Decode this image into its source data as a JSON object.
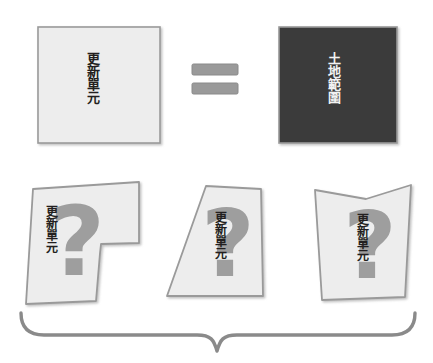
{
  "diagram": {
    "title_text_top_left": "更新單元",
    "title_text_top_right": "土地範圍",
    "equals_symbol": "=",
    "colors": {
      "light_fill": "#ededed",
      "dark_fill": "#3a3a3a",
      "shape_stroke": "#9a9a9a",
      "question_mark": "#9e9e9e",
      "brace_stroke": "#8a8a8a",
      "text_dark": "#231f20",
      "text_light": "#f2f2f2",
      "background": "#ffffff"
    },
    "top_row": {
      "left_box": {
        "name": "更新單元",
        "fill": "#ededed",
        "text_color": "#231f20"
      },
      "operator": {
        "symbol": "=",
        "bar_count": 2,
        "fill": "#9a9a9a"
      },
      "right_box": {
        "name": "土地範圍",
        "fill": "#3a3a3a",
        "text_color": "#f2f2f2"
      }
    },
    "bottom_row": {
      "shapes": [
        {
          "name": "更新單元",
          "marker": "?",
          "form": "notched-polygon"
        },
        {
          "name": "更新單元",
          "marker": "?",
          "form": "slanted-trapezoid"
        },
        {
          "name": "更新單元",
          "marker": "?",
          "form": "v-notch-polygon"
        }
      ],
      "brace": {
        "direction": "down",
        "symbol": "}"
      }
    }
  }
}
